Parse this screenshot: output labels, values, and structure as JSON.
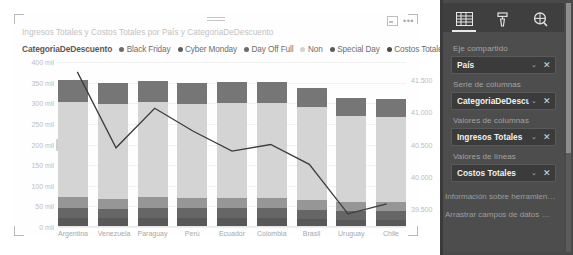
{
  "visual": {
    "title": "Ingresos Totales y Costos Totales por País y CategoriaDeDescuento",
    "focus_icon": "focus-mode-icon",
    "more_icon": "more-options-icon",
    "drag_icon": "drag-handle-icon"
  },
  "legend": {
    "title": "CategoriaDeDescuento",
    "items": [
      {
        "label": "Black Friday",
        "color": "#6b6b6b"
      },
      {
        "label": "Cyber Monday",
        "color": "#5e5e5e"
      },
      {
        "label": "Day Off Full",
        "color": "#6b6b6b"
      },
      {
        "label": "Non",
        "color": "#d2d2d2"
      },
      {
        "label": "Special Day",
        "color": "#5b5b5b"
      },
      {
        "label": "Costos Totales",
        "color": "#4a4a4a"
      }
    ]
  },
  "chart_data": {
    "type": "bar",
    "title": "Ingresos Totales y Costos Totales por País y CategoriaDeDescuento",
    "xlabel": "",
    "ylabel": "",
    "grid": true,
    "legend_position": "top",
    "categories": [
      "Argentina",
      "Venezuela",
      "Paraguay",
      "Perú",
      "Ecuador",
      "Colombia",
      "Brasil",
      "Uruguay",
      "Chile"
    ],
    "yticks_left": [
      "400 mil",
      "350 mil",
      "300 mil",
      "250 mil",
      "200 mil",
      "150 mil",
      "100 mil",
      "50 mil",
      "0 mil"
    ],
    "ylim_left": [
      0,
      400000
    ],
    "yticks_right": [
      "41.500",
      "41.000",
      "40.500",
      "40.000",
      "39.500"
    ],
    "ylim_right": [
      39250,
      41750
    ],
    "series": [
      {
        "name": "Black Friday",
        "color": "#767676",
        "values": [
          52000,
          50000,
          51000,
          50000,
          51000,
          50000,
          48000,
          44000,
          44000
        ]
      },
      {
        "name": "Cyber Monday",
        "color": "#585858",
        "values": [
          22000,
          21000,
          23000,
          22000,
          21000,
          22000,
          20000,
          18000,
          18000
        ]
      },
      {
        "name": "Day Off Full",
        "color": "#969696",
        "values": [
          26000,
          25000,
          26000,
          25000,
          26000,
          25000,
          24000,
          22000,
          22000
        ]
      },
      {
        "name": "Non",
        "color": "#d4d4d4",
        "values": [
          232000,
          230000,
          231000,
          229000,
          230000,
          231000,
          224000,
          210000,
          206000
        ]
      },
      {
        "name": "Special Day",
        "color": "#666666",
        "values": [
          24000,
          23000,
          24000,
          23000,
          24000,
          23000,
          22000,
          20000,
          20000
        ]
      }
    ],
    "line_series": {
      "name": "Costos Totales",
      "color": "#3c3c3c",
      "values": [
        41600,
        40450,
        41050,
        40700,
        40400,
        40500,
        40200,
        39450,
        39600
      ]
    }
  },
  "pane": {
    "tabs": [
      {
        "name": "fields-tab",
        "icon": "fields-grid-icon",
        "active": true
      },
      {
        "name": "format-tab",
        "icon": "paint-roller-icon",
        "active": false
      },
      {
        "name": "analytics-tab",
        "icon": "magnifier-icon",
        "active": false
      }
    ],
    "wells": [
      {
        "label": "Eje compartido",
        "chip": "País",
        "caret": "⌄",
        "close": "✕"
      },
      {
        "label": "Serie de columnas",
        "chip": "CategoriaDeDescuento",
        "caret": "⌄",
        "close": "✕"
      },
      {
        "label": "Valores de columnas",
        "chip": "Ingresos Totales",
        "caret": "⌄",
        "close": "✕"
      },
      {
        "label": "Valores de líneas",
        "chip": "Costos Totales",
        "caret": "⌄",
        "close": "✕"
      }
    ],
    "footer": [
      "Información sobre herramien…",
      "Arrastrar campos de datos …"
    ]
  }
}
